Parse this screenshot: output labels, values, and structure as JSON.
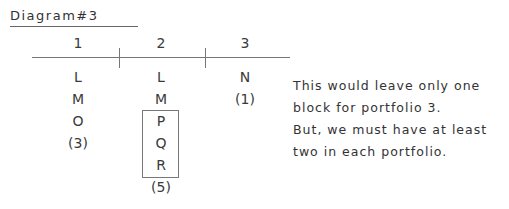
{
  "title": "Diagram#3",
  "columns": [
    {
      "header": "1",
      "items": [
        "L",
        "M",
        "O",
        "(3)"
      ]
    },
    {
      "header": "2",
      "items": [
        "L",
        "M",
        "P",
        "Q",
        "R",
        "(5)"
      ]
    },
    {
      "header": "3",
      "items": [
        "N",
        "(1)"
      ]
    }
  ],
  "boxed_items": [
    "P",
    "Q",
    "R"
  ],
  "note_lines": [
    "This would leave only one",
    "block for portfolio 3.",
    "But, we must have at least",
    "two in each portfolio."
  ]
}
